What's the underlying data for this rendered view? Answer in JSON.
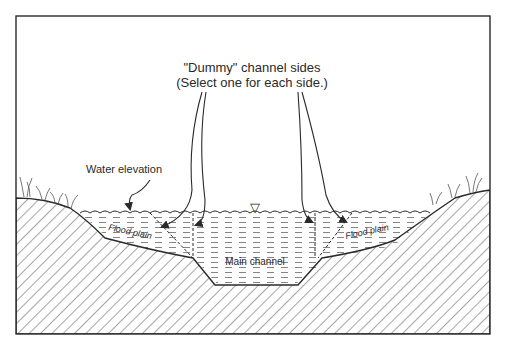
{
  "diagram": {
    "title_line1": "\"Dummy\" channel sides",
    "title_line2": "(Select one for each side.)",
    "labels": {
      "water_elevation": "Water elevation",
      "flood_plain_left": "Flood plain",
      "flood_plain_right": "Flood plain",
      "main_channel": "Main channel"
    },
    "symbols": {
      "water_surface_marker": "▽"
    },
    "colors": {
      "ink": "#2a2a2a",
      "background": "#ffffff",
      "hatch": "#3a3a3a",
      "water_dash": "#6a6a6a"
    }
  }
}
